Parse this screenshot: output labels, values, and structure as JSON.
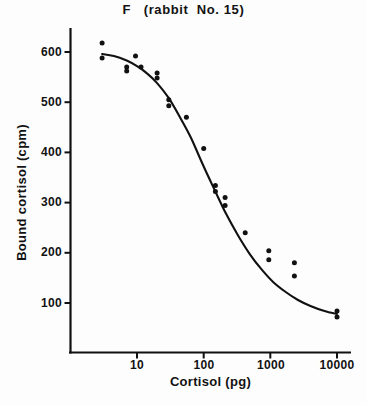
{
  "chart_data": {
    "type": "scatter",
    "title": "F   (rabbit  No. 15)",
    "xlabel": "Cortisol (pg)",
    "ylabel": "Bound cortisol (cpm)",
    "xscale": "log",
    "yscale": "linear",
    "xlim": [
      2,
      16000
    ],
    "ylim": [
      0,
      660
    ],
    "grid": false,
    "legend": null,
    "xticks": [
      10,
      100,
      1000,
      10000
    ],
    "xtick_labels": [
      "10",
      "100",
      "1000",
      "10000"
    ],
    "yticks": [
      100,
      200,
      300,
      400,
      500,
      600
    ],
    "ytick_labels": [
      "100",
      "200",
      "300",
      "400",
      "500",
      "600"
    ],
    "marker": "filled-circle",
    "marker_color": "#111111",
    "curve_color": "#111111",
    "points": [
      {
        "x": 3.0,
        "y": 618
      },
      {
        "x": 3.0,
        "y": 588
      },
      {
        "x": 7.0,
        "y": 570
      },
      {
        "x": 7.0,
        "y": 562
      },
      {
        "x": 9.5,
        "y": 592
      },
      {
        "x": 11.5,
        "y": 570
      },
      {
        "x": 20.0,
        "y": 558
      },
      {
        "x": 20.0,
        "y": 548
      },
      {
        "x": 30.0,
        "y": 505
      },
      {
        "x": 30.0,
        "y": 493
      },
      {
        "x": 55.0,
        "y": 470
      },
      {
        "x": 100.0,
        "y": 408
      },
      {
        "x": 150.0,
        "y": 334
      },
      {
        "x": 150.0,
        "y": 322
      },
      {
        "x": 210.0,
        "y": 310
      },
      {
        "x": 210.0,
        "y": 294
      },
      {
        "x": 420.0,
        "y": 240
      },
      {
        "x": 950.0,
        "y": 204
      },
      {
        "x": 950.0,
        "y": 186
      },
      {
        "x": 2300.0,
        "y": 180
      },
      {
        "x": 2300.0,
        "y": 154
      },
      {
        "x": 10000.0,
        "y": 84
      },
      {
        "x": 10000.0,
        "y": 72
      }
    ],
    "fitted_curve": [
      {
        "x": 3.0,
        "y": 596
      },
      {
        "x": 4.5,
        "y": 592
      },
      {
        "x": 7.0,
        "y": 583
      },
      {
        "x": 10.0,
        "y": 572
      },
      {
        "x": 14.0,
        "y": 558
      },
      {
        "x": 20.0,
        "y": 538
      },
      {
        "x": 30.0,
        "y": 508
      },
      {
        "x": 45.0,
        "y": 468
      },
      {
        "x": 65.0,
        "y": 428
      },
      {
        "x": 100.0,
        "y": 372
      },
      {
        "x": 150.0,
        "y": 322
      },
      {
        "x": 220.0,
        "y": 276
      },
      {
        "x": 330.0,
        "y": 234
      },
      {
        "x": 500.0,
        "y": 196
      },
      {
        "x": 750.0,
        "y": 166
      },
      {
        "x": 1100.0,
        "y": 142
      },
      {
        "x": 1700.0,
        "y": 122
      },
      {
        "x": 2600.0,
        "y": 106
      },
      {
        "x": 4000.0,
        "y": 94
      },
      {
        "x": 6500.0,
        "y": 84
      },
      {
        "x": 10000.0,
        "y": 78
      }
    ]
  }
}
